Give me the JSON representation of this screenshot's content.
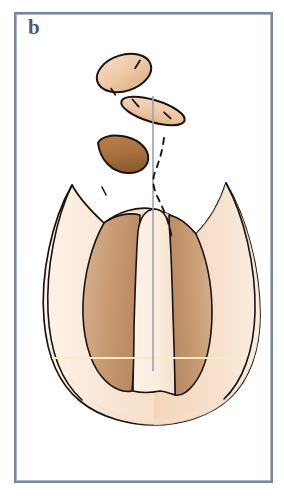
{
  "figure": {
    "panel_label": "b",
    "label_color": "#4d5578",
    "frame_color": "#7c83a6",
    "background_color": "#ffffff",
    "type": "anatomical-line-illustration"
  },
  "palette": {
    "outline": "#1a1410",
    "flesh_light": "#f7e2cf",
    "flesh_mid": "#efc9a8",
    "flesh_pale": "#fdf1e6",
    "tan_dark": "#c79a72",
    "brown_dark": "#a9713f",
    "brown_deep": "#8a5a31",
    "midline": "#9aa0b4",
    "dashed": "#1a1410",
    "hairline_yellow": "#f6f2c8"
  },
  "elements": {
    "upper_oval": {
      "name": "detached-oval-fragment",
      "cx": 124,
      "cy": 73,
      "rx": 28,
      "ry": 18,
      "rotation_deg": -18,
      "fill": "#f0cdae",
      "notches": 2
    },
    "lens_fragment": {
      "name": "detached-lens-fragment",
      "cx": 153,
      "cy": 111,
      "rx": 32,
      "ry": 11,
      "rotation_deg": 18,
      "fill": "#f0cdae",
      "notches": 2
    },
    "crescent_fragment": {
      "name": "detached-crescent-fragment",
      "cx": 125,
      "cy": 152,
      "width": 52,
      "height": 28,
      "fill": "#a9713f"
    },
    "main_body": {
      "name": "main-organ-outline",
      "top": 160,
      "bottom": 405,
      "left": 24,
      "right": 248,
      "fill": "#f7e2cf"
    },
    "central_lobe": {
      "name": "central-pointed-lobe",
      "apex_y": 196,
      "base_y": 370,
      "fill": "#fdf1e6"
    },
    "left_dark_wing": {
      "name": "left-dark-wing",
      "fill": "#c79a72"
    },
    "right_dark_wing": {
      "name": "right-dark-wing",
      "fill": "#c79a72"
    },
    "midline_axis": {
      "name": "vertical-midline-axis",
      "x": 153,
      "y_top": 96,
      "y_bottom": 371,
      "color": "#9aa0b4",
      "width_px": 1.6
    },
    "dashed_contour": {
      "name": "dashed-contour-line",
      "color": "#1a1410",
      "dash_pattern": "6 6",
      "x_start": 160,
      "y_start": 138,
      "y_end": 240
    },
    "pale_horizontal_rule": {
      "name": "pale-horizontal-reference-line",
      "y": 358,
      "x_start": 52,
      "x_end": 238,
      "color": "#f6f2c8"
    }
  }
}
